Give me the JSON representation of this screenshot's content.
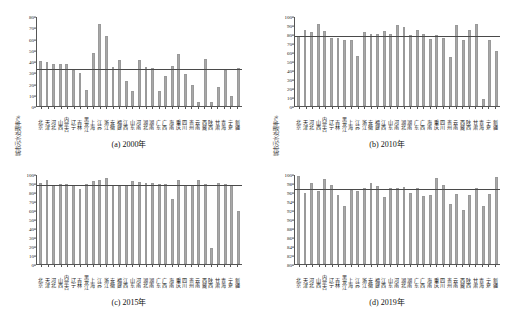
{
  "figure": {
    "ylabel": "城市污水处理率/%",
    "provinces": [
      "北京",
      "天津",
      "河北",
      "山西",
      "内蒙古",
      "辽宁",
      "吉林",
      "黑龙江",
      "上海",
      "江苏",
      "浙江",
      "安徽",
      "福建",
      "江西",
      "山东",
      "河南",
      "湖北",
      "湖南",
      "广东",
      "广西",
      "海南",
      "重庆",
      "四川",
      "贵州",
      "云南",
      "西藏",
      "陕西",
      "甘肃",
      "青海",
      "宁夏",
      "新疆"
    ]
  },
  "chart_data": [
    {
      "type": "bar",
      "panel": "a",
      "title": "(a) 2000年",
      "xlabel": "",
      "ylabel": "城市污水处理率/%",
      "ylim": [
        0,
        80
      ],
      "yticks": [
        0,
        10,
        20,
        30,
        40,
        50,
        60,
        70,
        80
      ],
      "grid": false,
      "mean_line": 32.5,
      "bar_color": "#a8a8a8",
      "categories": [
        "北京",
        "天津",
        "河北",
        "山西",
        "内蒙古",
        "辽宁",
        "吉林",
        "黑龙江",
        "上海",
        "江苏",
        "浙江",
        "安徽",
        "福建",
        "江西",
        "山东",
        "河南",
        "湖北",
        "湖南",
        "广东",
        "广西",
        "海南",
        "重庆",
        "四川",
        "贵州",
        "云南",
        "西藏",
        "陕西",
        "甘肃",
        "青海",
        "宁夏",
        "新疆"
      ],
      "values": [
        40.0,
        39.0,
        37.0,
        37.0,
        37.0,
        32.0,
        29.5,
        14.5,
        47.5,
        73.0,
        62.0,
        35.0,
        41.0,
        22.5,
        13.5,
        41.0,
        34.5,
        33.5,
        13.0,
        27.0,
        35.5,
        46.0,
        28.5,
        18.5,
        4.0,
        42.0,
        3.5,
        16.5,
        32.0,
        8.5,
        34.0,
        60.5
      ]
    },
    {
      "type": "bar",
      "panel": "b",
      "title": "(b) 2010年",
      "xlabel": "",
      "ylabel": "城市污水处理率/%",
      "ylim": [
        0,
        100
      ],
      "yticks": [
        0,
        10,
        20,
        30,
        40,
        50,
        60,
        70,
        80,
        90,
        100
      ],
      "grid": false,
      "mean_line": 77.0,
      "bar_color": "#a8a8a8",
      "categories": [
        "北京",
        "天津",
        "河北",
        "山西",
        "内蒙古",
        "辽宁",
        "吉林",
        "黑龙江",
        "上海",
        "江苏",
        "浙江",
        "安徽",
        "福建",
        "江西",
        "山东",
        "河南",
        "湖北",
        "湖南",
        "广东",
        "广西",
        "海南",
        "重庆",
        "四川",
        "贵州",
        "云南",
        "西藏",
        "陕西",
        "甘肃",
        "青海",
        "宁夏",
        "新疆"
      ],
      "values": [
        78.0,
        84.0,
        82.0,
        91.0,
        83.0,
        76.0,
        75.5,
        73.5,
        73.5,
        56.0,
        82.0,
        80.0,
        79.5,
        83.0,
        79.5,
        90.0,
        88.0,
        79.0,
        85.0,
        80.0,
        74.5,
        79.0,
        76.0,
        54.5,
        90.5,
        73.5,
        85.0,
        91.5,
        7.5,
        73.0,
        61.0,
        42.5,
        79.5,
        72.0
      ]
    },
    {
      "type": "bar",
      "panel": "c",
      "title": "(c) 2015年",
      "xlabel": "",
      "ylabel": "城市污水处理率/%",
      "ylim": [
        0,
        100
      ],
      "yticks": [
        0,
        10,
        20,
        30,
        40,
        50,
        60,
        70,
        80,
        90,
        100
      ],
      "grid": false,
      "mean_line": 87.0,
      "bar_color": "#a8a8a8",
      "categories": [
        "北京",
        "天津",
        "河北",
        "山西",
        "内蒙古",
        "辽宁",
        "吉林",
        "黑龙江",
        "上海",
        "江苏",
        "浙江",
        "安徽",
        "福建",
        "江西",
        "山东",
        "河南",
        "湖北",
        "湖南",
        "广东",
        "广西",
        "海南",
        "重庆",
        "四川",
        "贵州",
        "云南",
        "西藏",
        "陕西",
        "甘肃",
        "青海",
        "宁夏",
        "新疆"
      ],
      "values": [
        90.0,
        93.5,
        87.5,
        88.5,
        89.0,
        88.0,
        83.0,
        88.5,
        92.0,
        93.0,
        95.5,
        88.0,
        86.5,
        88.0,
        92.0,
        91.5,
        90.0,
        89.5,
        89.0,
        88.5,
        72.5,
        93.5,
        87.5,
        88.0,
        93.0,
        89.0,
        17.5,
        90.0,
        88.5,
        88.0,
        58.5,
        90.0,
        82.0
      ]
    },
    {
      "type": "bar",
      "panel": "d",
      "title": "(d) 2019年",
      "xlabel": "",
      "ylabel": "城市污水处理率/%",
      "ylim": [
        80,
        100
      ],
      "yticks": [
        80,
        82,
        84,
        86,
        88,
        90,
        92,
        94,
        96,
        98,
        100
      ],
      "grid": false,
      "mean_line": 96.4,
      "bar_color": "#a8a8a8",
      "categories": [
        "北京",
        "天津",
        "河北",
        "山西",
        "内蒙古",
        "辽宁",
        "吉林",
        "黑龙江",
        "上海",
        "江苏",
        "浙江",
        "安徽",
        "福建",
        "江西",
        "山东",
        "河南",
        "湖北",
        "湖南",
        "广东",
        "广西",
        "海南",
        "重庆",
        "四川",
        "贵州",
        "云南",
        "西藏",
        "陕西",
        "甘肃",
        "青海",
        "宁夏",
        "新疆"
      ],
      "values": [
        99.5,
        95.8,
        98.0,
        96.2,
        98.9,
        97.5,
        95.3,
        93.0,
        96.5,
        96.2,
        96.8,
        98.0,
        97.3,
        94.8,
        96.8,
        96.9,
        97.2,
        95.8,
        96.9,
        95.2,
        95.3,
        99.2,
        97.5,
        93.3,
        95.5,
        91.9,
        95.4,
        96.8,
        92.9,
        95.5,
        99.4
      ]
    }
  ]
}
